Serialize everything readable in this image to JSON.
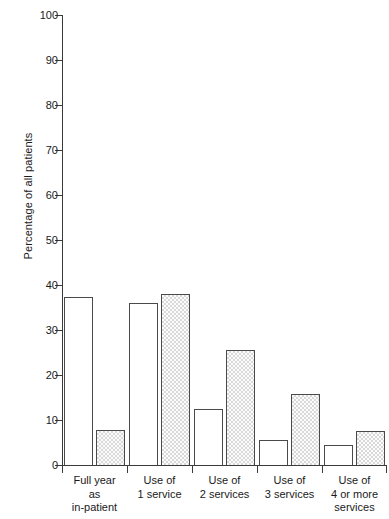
{
  "chart_data": {
    "type": "bar",
    "title": "",
    "subtitle": "",
    "xlabel": "",
    "ylabel": "Percentage of all patients",
    "ylim": [
      0,
      100
    ],
    "yticks": [
      0,
      10,
      20,
      30,
      40,
      50,
      60,
      70,
      80,
      90,
      100
    ],
    "ytick_labels": [
      "0",
      "10",
      "20",
      "30",
      "40",
      "50",
      "60",
      "70",
      "80",
      "90",
      "100"
    ],
    "grid": false,
    "legend": "none",
    "categories": [
      "Full year as in-patient",
      "Use of 1 service",
      "Use of 2 services",
      "Use of 3 services",
      "Use of 4 or more services"
    ],
    "category_label_lines": [
      [
        "Full year",
        "as",
        "in-patient"
      ],
      [
        "Use of",
        "1 service"
      ],
      [
        "Use of",
        "2 services"
      ],
      [
        "Use of",
        "3 services"
      ],
      [
        "Use of",
        "4 or more",
        "services"
      ]
    ],
    "series": [
      {
        "name": "open",
        "style": "white-fill",
        "values": [
          37.3,
          36.0,
          12.4,
          5.6,
          4.4
        ]
      },
      {
        "name": "hatched",
        "style": "stippled-grey-fill",
        "values": [
          7.8,
          38.0,
          25.6,
          15.8,
          7.5
        ]
      }
    ]
  },
  "colors": {
    "axis": "#3a3a3a",
    "bar_outline": "#4a4a4a",
    "open_fill": "#ffffff",
    "hatched_fill": "#e8e8e8",
    "text": "#1a1a1a",
    "background": "#ffffff"
  }
}
